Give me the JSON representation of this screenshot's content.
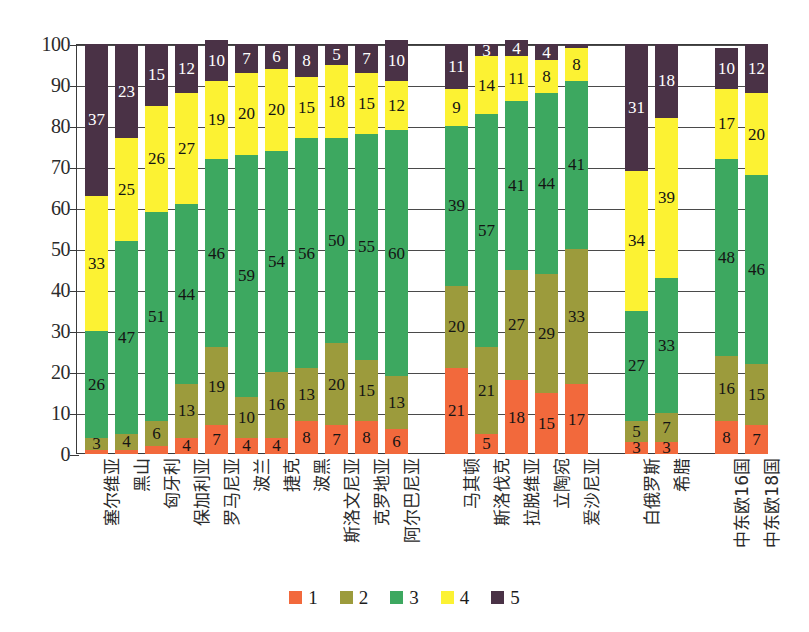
{
  "chart_data": {
    "type": "bar",
    "subtype": "stacked-column-100",
    "title": "",
    "xlabel": "",
    "ylabel": "",
    "ylim": [
      0,
      100
    ],
    "ytick_step": 10,
    "ytick_labels": [
      "0",
      "10",
      "20",
      "30",
      "40",
      "50",
      "60",
      "70",
      "80",
      "90",
      "100"
    ],
    "grid": true,
    "legend_position": "bottom",
    "categories": [
      "塞尔维亚",
      "黑山",
      "匈牙利",
      "保加利亚",
      "罗马尼亚",
      "波兰",
      "捷克",
      "波黑",
      "斯洛文尼亚",
      "克罗地亚",
      "阿尔巴尼亚",
      "马其顿",
      "斯洛伐克",
      "拉脱维亚",
      "立陶宛",
      "爱沙尼亚",
      "白俄罗斯",
      "希腊",
      "中东欧16国",
      "中东欧18国"
    ],
    "series": [
      {
        "name": "1",
        "color": "#F2693C",
        "values": [
          1,
          1,
          2,
          4,
          7,
          4,
          4,
          8,
          7,
          8,
          6,
          21,
          5,
          18,
          15,
          17,
          3,
          3,
          8,
          7
        ]
      },
      {
        "name": "2",
        "color": "#9C9B3C",
        "values": [
          3,
          4,
          6,
          13,
          19,
          10,
          16,
          13,
          20,
          15,
          13,
          20,
          21,
          27,
          29,
          33,
          5,
          7,
          16,
          15
        ]
      },
      {
        "name": "3",
        "color": "#3DA860",
        "values": [
          26,
          47,
          51,
          44,
          46,
          59,
          54,
          56,
          50,
          55,
          60,
          39,
          57,
          41,
          44,
          41,
          27,
          33,
          48,
          46
        ]
      },
      {
        "name": "4",
        "color": "#FCF233",
        "values": [
          33,
          25,
          26,
          27,
          19,
          20,
          20,
          15,
          18,
          15,
          12,
          9,
          14,
          11,
          8,
          8,
          34,
          39,
          17,
          20
        ]
      },
      {
        "name": "5",
        "color": "#4A3246",
        "values": [
          37,
          23,
          15,
          12,
          10,
          7,
          6,
          8,
          5,
          7,
          10,
          11,
          3,
          4,
          4,
          1,
          31,
          18,
          10,
          12
        ]
      }
    ],
    "group_gaps_after": [
      10,
      15,
      17
    ],
    "legend": [
      {
        "label": "1",
        "color": "#F2693C"
      },
      {
        "label": "2",
        "color": "#9C9B3C"
      },
      {
        "label": "3",
        "color": "#3DA860"
      },
      {
        "label": "4",
        "color": "#FCF233"
      },
      {
        "label": "5",
        "color": "#4A3246"
      }
    ]
  }
}
